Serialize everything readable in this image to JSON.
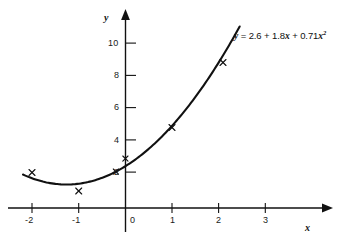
{
  "figure": {
    "background_color": "#ffffff",
    "ink_color": "#111111"
  },
  "chart_data": {
    "type": "scatter",
    "title": "",
    "xlabel": "x",
    "ylabel": "y",
    "xlim": [
      -2.45,
      3.6
    ],
    "ylim": [
      -0.6,
      11.2
    ],
    "grid": false,
    "legend": "none",
    "x_ticks": [
      -2,
      -1,
      0,
      1,
      2,
      3
    ],
    "x_tick_labels": [
      "-2",
      "-1",
      "0",
      "1",
      "2",
      "3"
    ],
    "y_ticks": [
      2,
      4,
      6,
      8,
      10
    ],
    "y_tick_labels": [
      "2",
      "4",
      "6",
      "8",
      "10"
    ],
    "points": [
      {
        "x": -2,
        "y": 1.9
      },
      {
        "x": -1,
        "y": 1.0
      },
      {
        "x": -0.2,
        "y": 2.2
      },
      {
        "x": 0.0,
        "y": 3.0
      },
      {
        "x": 1.0,
        "y": 5.0
      },
      {
        "x": 2.1,
        "y": 9.0
      }
    ],
    "marker": "x",
    "curve": {
      "label": "y = 2.6 + 1.8x + 0.71x^2",
      "coefficients": {
        "intercept": 2.6,
        "linear": 1.8,
        "quadratic": 0.71
      },
      "x_start": -2.2,
      "x_end": 2.45
    },
    "annotations": [
      {
        "text_parts": {
          "y": "y",
          "eq": " = 2.6 + 1.8",
          "x1": "x",
          "plus": " + 0.71",
          "x2": "x",
          "exp": "2"
        }
      }
    ]
  },
  "axes": {
    "x_axis_label": "x",
    "y_axis_label": "y"
  }
}
